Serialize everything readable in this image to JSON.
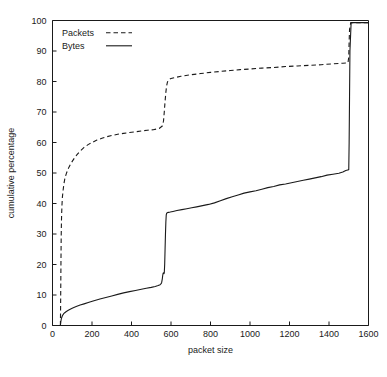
{
  "chart_data": {
    "type": "line",
    "title": "",
    "xlabel": "packet size",
    "ylabel": "cumulative percentage",
    "xlim": [
      0,
      1600
    ],
    "ylim": [
      0,
      100
    ],
    "grid": false,
    "legend_position": "top-left",
    "xticks": [
      0,
      200,
      400,
      600,
      800,
      1000,
      1200,
      1400,
      1600
    ],
    "xtick_labels": [
      "0",
      "200",
      "400",
      "600",
      "800",
      "1000",
      "1200",
      "1400",
      "1600"
    ],
    "yticks": [
      0,
      10,
      20,
      30,
      40,
      50,
      60,
      70,
      80,
      90,
      100
    ],
    "ytick_labels": [
      "0",
      "10",
      "20",
      "30",
      "40",
      "50",
      "60",
      "70",
      "80",
      "90",
      "100"
    ],
    "series": [
      {
        "name": "Packets",
        "style": "dashed",
        "color": "#1a1a1a",
        "x": [
          40,
          41,
          42,
          43,
          44,
          45,
          46,
          48,
          50,
          54,
          58,
          62,
          66,
          70,
          76,
          84,
          92,
          100,
          112,
          124,
          140,
          160,
          180,
          200,
          225,
          250,
          275,
          300,
          330,
          360,
          390,
          420,
          450,
          480,
          510,
          540,
          556,
          562,
          566,
          570,
          574,
          578,
          582,
          586,
          590,
          600,
          620,
          650,
          700,
          750,
          800,
          850,
          900,
          950,
          1000,
          1060,
          1120,
          1180,
          1240,
          1300,
          1360,
          1420,
          1470,
          1496,
          1500,
          1502,
          1504,
          1510,
          1600
        ],
        "y": [
          0,
          6,
          14,
          22,
          29,
          33,
          36,
          39.5,
          42,
          44.5,
          46.5,
          48,
          49,
          49.8,
          50.8,
          52,
          53,
          53.8,
          55,
          56,
          57.2,
          58.4,
          59.3,
          60,
          60.8,
          61.4,
          61.9,
          62.3,
          62.7,
          63,
          63.3,
          63.5,
          63.8,
          64,
          64.2,
          64.6,
          65.4,
          67,
          70,
          73.5,
          76.5,
          78.6,
          79.8,
          80.4,
          80.7,
          81,
          81.3,
          81.7,
          82.2,
          82.6,
          83,
          83.3,
          83.6,
          83.9,
          84.1,
          84.4,
          84.6,
          84.9,
          85.1,
          85.3,
          85.5,
          85.8,
          86,
          86.1,
          88,
          93,
          97,
          99.3,
          99.3
        ]
      },
      {
        "name": "Bytes",
        "style": "solid",
        "color": "#1a1a1a",
        "x": [
          40,
          42,
          45,
          50,
          56,
          62,
          70,
          80,
          92,
          105,
          120,
          140,
          160,
          185,
          210,
          240,
          270,
          300,
          330,
          360,
          390,
          420,
          450,
          475,
          500,
          520,
          535,
          545,
          550,
          553,
          556,
          558,
          560,
          562,
          564,
          566,
          568,
          570,
          572,
          574,
          576,
          578,
          582,
          588,
          596,
          610,
          630,
          655,
          680,
          705,
          730,
          760,
          790,
          820,
          850,
          880,
          910,
          940,
          970,
          1000,
          1030,
          1060,
          1090,
          1120,
          1150,
          1180,
          1210,
          1240,
          1270,
          1300,
          1330,
          1360,
          1390,
          1420,
          1450,
          1470,
          1485,
          1495,
          1500,
          1502,
          1504,
          1506,
          1512,
          1600
        ],
        "y": [
          0,
          1.2,
          2.3,
          3.2,
          3.8,
          4.2,
          4.6,
          5,
          5.4,
          5.8,
          6.2,
          6.7,
          7.1,
          7.6,
          8.1,
          8.7,
          9.2,
          9.7,
          10.2,
          10.7,
          11.1,
          11.5,
          11.9,
          12.2,
          12.5,
          12.8,
          13.1,
          13.4,
          13.7,
          14.2,
          15.3,
          16.4,
          17.1,
          17.3,
          17,
          17.2,
          20,
          25,
          30,
          34,
          36.3,
          36.8,
          37,
          37.1,
          37.2,
          37.4,
          37.7,
          38,
          38.3,
          38.6,
          38.9,
          39.3,
          39.7,
          40.2,
          40.9,
          41.6,
          42.2,
          42.8,
          43.4,
          43.8,
          44.2,
          44.7,
          45.2,
          45.6,
          46.1,
          46.4,
          46.8,
          47.2,
          47.6,
          48,
          48.4,
          48.8,
          49.3,
          49.6,
          49.9,
          50.3,
          50.8,
          51,
          51.1,
          60,
          75,
          90,
          99.3,
          99.3
        ]
      }
    ]
  },
  "legend": {
    "entries": [
      {
        "label": "Packets",
        "style": "dashed"
      },
      {
        "label": "Bytes",
        "style": "solid"
      }
    ]
  }
}
